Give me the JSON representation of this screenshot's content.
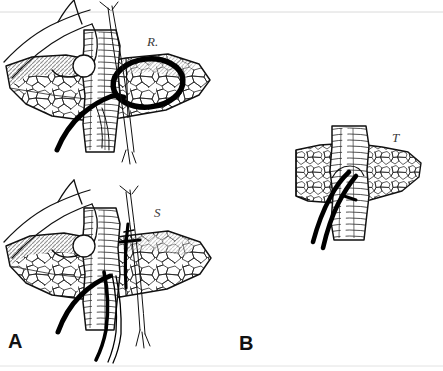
{
  "figure": {
    "width": 443,
    "height": 371,
    "background_color": "#ffffff",
    "ink_color": "#111111",
    "shading_color": "#9a9a9a",
    "style": "pen-and-ink surgical line drawing"
  },
  "panels": [
    {
      "id": "A",
      "letter": "A",
      "position": "left",
      "views": [
        {
          "id": "A-upper",
          "label": "R.",
          "label_style": "italic",
          "annotation": "heavy hand-drawn black oval marking a region on the meshwork tissue",
          "elements": [
            "gloved hand with index finger retracting tissue",
            "vertical hatched tubular structure",
            "polygonal meshwork tissue flap",
            "shaded hatched tissue margin",
            "thick black catheter curving to lower left",
            "fine suture strands above and below"
          ]
        },
        {
          "id": "A-lower",
          "label": "S",
          "label_style": "italic",
          "annotation": "black suture line placed vertically across the tissue junction",
          "elements": [
            "gloved hand with index finger retracting tissue",
            "vertical hatched tubular structure",
            "polygonal meshwork tissue flap",
            "shaded hatched tissue margin",
            "thick black catheter curving to lower left",
            "multiple black catheters and fine suture strands descending"
          ]
        }
      ]
    },
    {
      "id": "B",
      "letter": "B",
      "position": "right",
      "views": [
        {
          "id": "B-detail",
          "label": "T",
          "label_style": "italic",
          "annotation": "detail view of the tube traversing the tissue",
          "elements": [
            "vertical hatched tubular structure",
            "polygonal meshwork tissue collar",
            "two thick black catheters emerging to the lower left"
          ]
        }
      ]
    }
  ],
  "labels": {
    "panel_a": "A",
    "panel_b": "B",
    "structure_r": "R.",
    "structure_s": "S",
    "structure_t": "T"
  }
}
